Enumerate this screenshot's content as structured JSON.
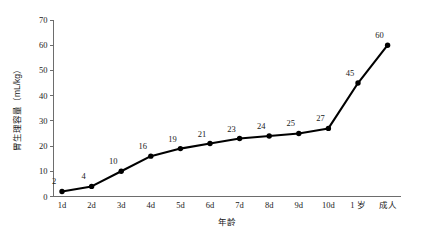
{
  "chart_data": {
    "type": "line",
    "title": "",
    "xlabel": "年龄",
    "ylabel": "胃生理容量（mL/kg）",
    "categories": [
      "1d",
      "2d",
      "3d",
      "4d",
      "5d",
      "6d",
      "7d",
      "8d",
      "9d",
      "10d",
      "1 岁",
      "成人"
    ],
    "values": [
      2,
      4,
      10,
      16,
      19,
      21,
      23,
      24,
      25,
      27,
      45,
      60
    ],
    "point_labels": [
      "2",
      "4",
      "10",
      "16",
      "19",
      "21",
      "23",
      "24",
      "25",
      "27",
      "45",
      "60"
    ],
    "ylim": [
      0,
      70
    ],
    "ytick_labels": [
      "0",
      "10",
      "20",
      "30",
      "40",
      "50",
      "60",
      "70"
    ],
    "ytick_values": [
      0,
      10,
      20,
      30,
      40,
      50,
      60,
      70
    ],
    "grid": false,
    "legend": false,
    "legend_position": "none",
    "series_color": "#000000",
    "marker": "filled-circle",
    "axis_color": "#6d6d6d",
    "background": "#ffffff"
  }
}
